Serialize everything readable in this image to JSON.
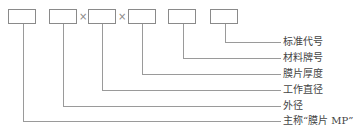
{
  "diagram": {
    "title": "",
    "separator_symbol": "×",
    "boxes": [
      {
        "id": "main-name",
        "x": 8
      },
      {
        "id": "outer-diameter",
        "x": 49
      },
      {
        "id": "working-diameter",
        "x": 88
      },
      {
        "id": "thickness",
        "x": 128
      },
      {
        "id": "material-grade",
        "x": 168
      },
      {
        "id": "standard-code",
        "x": 210
      }
    ],
    "labels": {
      "standard_code": "标准代号",
      "material_grade": "材料牌号",
      "thickness": "膜片厚度",
      "working_diameter": "工作直径",
      "outer_diameter": "外径",
      "main_name": "主称“膜片 MP”"
    },
    "colors": {
      "line": "#9a9a9a",
      "box_border": "#8a8a8a",
      "text": "#444444"
    }
  }
}
